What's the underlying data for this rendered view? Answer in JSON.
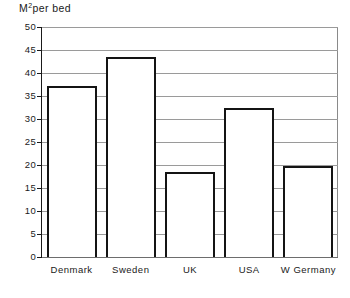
{
  "chart_data": {
    "type": "bar",
    "title": "",
    "xlabel": "",
    "ylabel": "M2per bed",
    "ylabel_base": "M",
    "ylabel_sup": "2",
    "ylabel_rest": "per bed",
    "categories": [
      "Denmark",
      "Sweden",
      "UK",
      "USA",
      "W Germany"
    ],
    "values": [
      37.2,
      43.5,
      18.5,
      32.5,
      19.8
    ],
    "ylim": [
      0,
      50
    ],
    "ytick_step": 5,
    "ytick_labels": [
      "50",
      "45",
      "40",
      "35",
      "30",
      "25",
      "20",
      "15",
      "10",
      "5",
      "0"
    ],
    "ytick_values": [
      50,
      45,
      40,
      35,
      30,
      25,
      20,
      15,
      10,
      5,
      0
    ],
    "grid": true,
    "legend": false,
    "legend_position": "none",
    "bar_fill": "#ffffff",
    "bar_outline": "#141414",
    "grid_color": "#9a9a9a",
    "background": "#ffffff"
  }
}
